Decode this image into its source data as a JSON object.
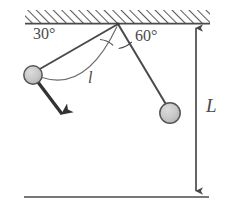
{
  "figure": {
    "labels": {
      "angle_left": "30°",
      "angle_right": "60°",
      "arc_length": "l",
      "height": "L"
    },
    "colors": {
      "stroke": "#4a4a4a",
      "ball_fill": "#c8c8c8",
      "ball_stroke": "#555555",
      "arrow": "#333333",
      "hatch": "#5a5a5a",
      "background": "#ffffff"
    },
    "geometry": {
      "pivot": {
        "x": 118,
        "y": 24
      },
      "ceiling": {
        "x1": 25,
        "x2": 210,
        "top": 10,
        "bottom": 24
      },
      "floor": {
        "x1": 24,
        "x2": 209,
        "y": 197
      },
      "ball_left": {
        "x": 33,
        "y": 75,
        "r": 9
      },
      "ball_right": {
        "x": 170,
        "y": 113,
        "r": 10
      },
      "velocity_arrow": {
        "x1": 38,
        "y1": 82,
        "x2": 65,
        "y2": 118
      },
      "height_arrow": {
        "x": 196,
        "y1": 26,
        "y2": 193
      }
    },
    "angles": {
      "left_from_vertical_deg": 60,
      "right_from_vertical_deg": 30,
      "left_label_deg": 30,
      "right_label_deg": 60
    }
  }
}
